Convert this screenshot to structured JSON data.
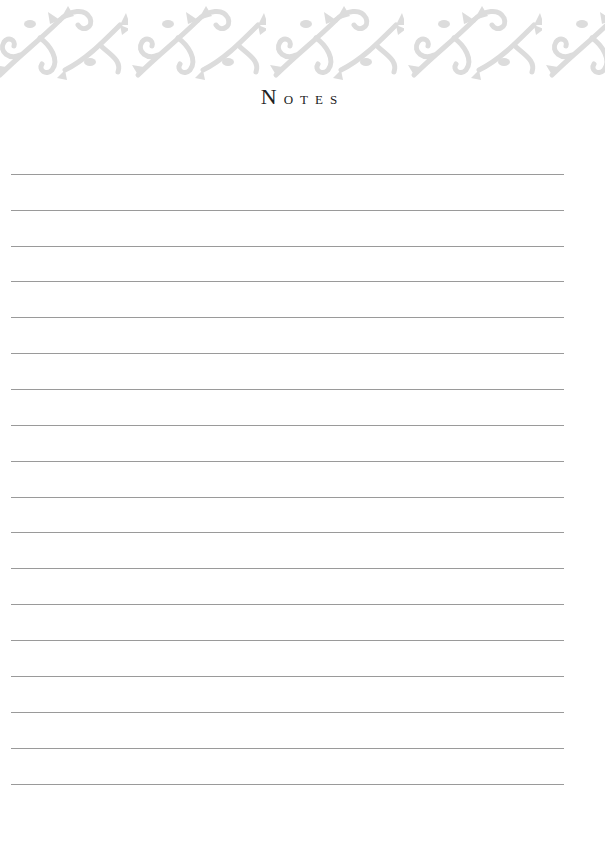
{
  "header": {
    "ornament": "scrollwork-vine-border",
    "ornament_color": "#dcdcdc"
  },
  "page": {
    "title_initial": "N",
    "title_rest": "otes",
    "title": "Notes"
  },
  "ruled_lines": {
    "count": 18,
    "color": "#9a9a9a",
    "positions_y": [
      174,
      210,
      246,
      281,
      317,
      353,
      389,
      425,
      461,
      497,
      532,
      568,
      604,
      640,
      676,
      712,
      748,
      784
    ]
  }
}
